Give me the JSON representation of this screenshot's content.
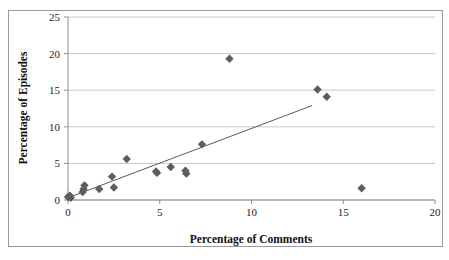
{
  "chart_data": {
    "type": "scatter",
    "title": "",
    "xlabel": "Percentage of Comments",
    "ylabel": "Percentage of Episodes",
    "xlim": [
      0,
      20
    ],
    "ylim": [
      0,
      25
    ],
    "xticks": [
      "0",
      "5",
      "10",
      "15",
      "20"
    ],
    "yticks": [
      "0",
      "5",
      "10",
      "15",
      "20",
      "25"
    ],
    "xtick_values": [
      0,
      5,
      10,
      15,
      20
    ],
    "ytick_values": [
      0,
      5,
      10,
      15,
      20,
      25
    ],
    "grid": "horizontal",
    "legend": "none",
    "marker": "diamond",
    "marker_color": "#5d5d5d",
    "points": [
      {
        "x": 0.0,
        "y": 0.4
      },
      {
        "x": 0.1,
        "y": 0.6
      },
      {
        "x": 0.15,
        "y": 0.3
      },
      {
        "x": 0.8,
        "y": 1.1
      },
      {
        "x": 0.85,
        "y": 1.5
      },
      {
        "x": 0.9,
        "y": 2.0
      },
      {
        "x": 1.7,
        "y": 1.5
      },
      {
        "x": 2.4,
        "y": 3.2
      },
      {
        "x": 2.5,
        "y": 1.7
      },
      {
        "x": 3.2,
        "y": 5.6
      },
      {
        "x": 4.8,
        "y": 3.9
      },
      {
        "x": 4.85,
        "y": 3.7
      },
      {
        "x": 5.6,
        "y": 4.5
      },
      {
        "x": 6.4,
        "y": 4.0
      },
      {
        "x": 6.45,
        "y": 3.6
      },
      {
        "x": 7.3,
        "y": 7.6
      },
      {
        "x": 8.8,
        "y": 19.3
      },
      {
        "x": 13.6,
        "y": 15.1
      },
      {
        "x": 14.1,
        "y": 14.1
      },
      {
        "x": 16.0,
        "y": 1.6
      }
    ],
    "trendline": {
      "type": "linear",
      "x_start": 0.0,
      "y_start": 0.3,
      "x_end": 13.3,
      "y_end": 12.9,
      "color": "#5a5a5a"
    }
  }
}
